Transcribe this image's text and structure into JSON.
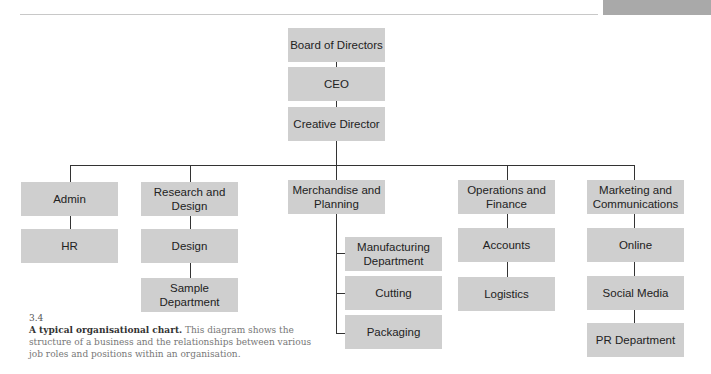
{
  "page": {
    "figure_number": "3.4",
    "caption_title": "A typical organisational chart.",
    "caption_body": " This diagram shows the structure of a business and the relationships between various job roles and positions within an organisation."
  },
  "chart": {
    "top": [
      "Board of Directors",
      "CEO",
      "Creative Director"
    ],
    "departments": [
      {
        "name": "Admin",
        "children": [
          "HR"
        ]
      },
      {
        "name": "Research and Design",
        "children": [
          "Design",
          "Sample Department"
        ]
      },
      {
        "name": "Merchandise and Planning",
        "children": [
          "Manufacturing Department",
          "Cutting",
          "Packaging"
        ]
      },
      {
        "name": "Operations and Finance",
        "children": [
          "Accounts",
          "Logistics"
        ]
      },
      {
        "name": "Marketing and Communications",
        "children": [
          "Online",
          "Social Media",
          "PR Department"
        ]
      }
    ]
  },
  "colors": {
    "box": "#cfcfcf",
    "line": "#333333"
  }
}
